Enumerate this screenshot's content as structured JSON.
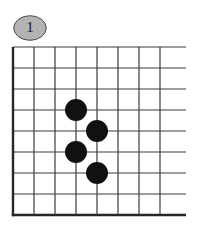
{
  "figure": {
    "badge_label": "1",
    "badge_fill": "#b3b3b3",
    "badge_stroke": "#4d4d4d",
    "badge_x": 13,
    "badge_y": 15,
    "badge_w": 34,
    "badge_h": 26
  },
  "board": {
    "type": "go-board-diagram",
    "description": "Go (baduk) corner diagram, left and bottom board edges shown",
    "line_color": "#3b3b3b",
    "edge_line_color": "#262626",
    "line_width": 1.2,
    "edge_line_width": 2.4,
    "grid_spacing": 21,
    "origin_x": 13,
    "origin_y": 47,
    "vertical_line_count": 8,
    "horizontal_line_count": 9,
    "left_edge_index": 0,
    "bottom_edge_index": 8,
    "right_overhang": 26,
    "vertical_line_xs": [
      13,
      34,
      55,
      76,
      97,
      118,
      139,
      160
    ],
    "horizontal_line_ys": [
      47,
      68,
      89,
      110,
      131,
      152,
      173,
      194,
      215
    ],
    "stone_radius": 11,
    "stones": [
      {
        "color": "#111111",
        "label": "",
        "col": 3,
        "row": 3,
        "cx": 76,
        "cy": 110
      },
      {
        "color": "#111111",
        "label": "",
        "col": 4,
        "row": 4,
        "cx": 97,
        "cy": 131
      },
      {
        "color": "#111111",
        "label": "",
        "col": 3,
        "row": 5,
        "cx": 76,
        "cy": 152
      },
      {
        "color": "#111111",
        "label": "",
        "col": 4,
        "row": 6,
        "cx": 97,
        "cy": 173
      }
    ]
  }
}
